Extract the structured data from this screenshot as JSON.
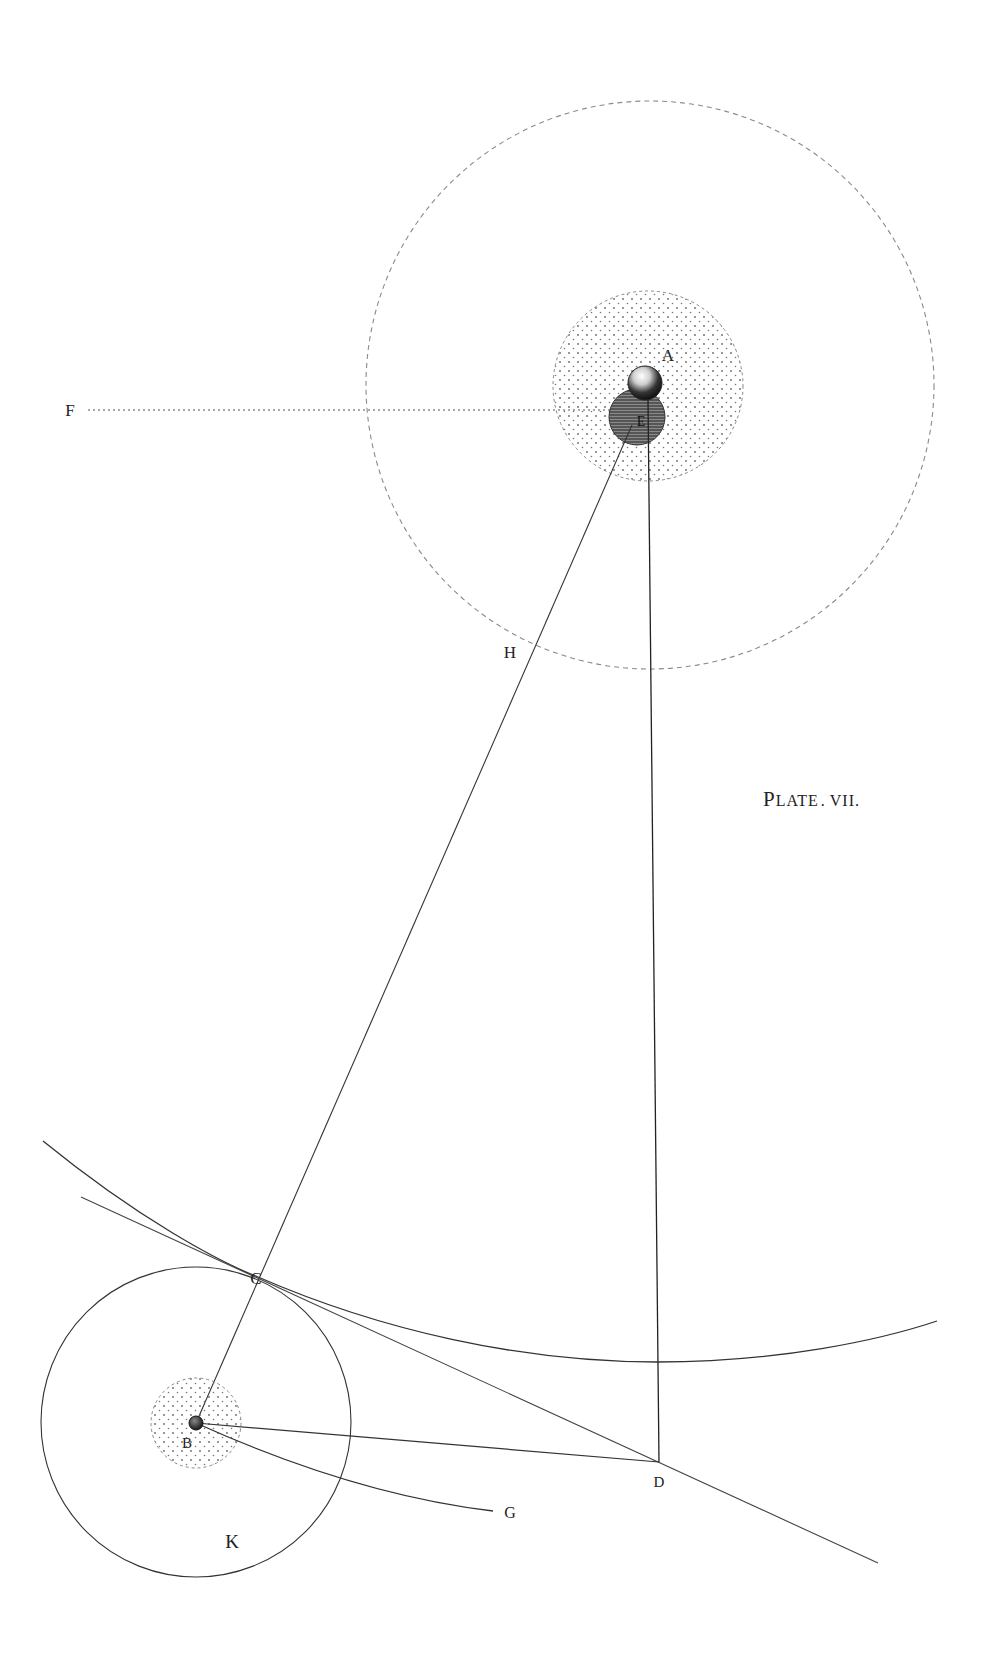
{
  "plate": {
    "title_cap": "P",
    "title_rest": "LATE",
    "title_sep": ".",
    "title_num": "VII",
    "title_end": "."
  },
  "labels": {
    "A": "A",
    "E": "E",
    "F": "F",
    "H": "H",
    "C": "C",
    "B": "B",
    "D": "D",
    "G": "G",
    "K": "K"
  },
  "colors": {
    "ink": "#222222",
    "dashed": "#777777",
    "dark_sphere": "#555555",
    "background": "#ffffff"
  }
}
